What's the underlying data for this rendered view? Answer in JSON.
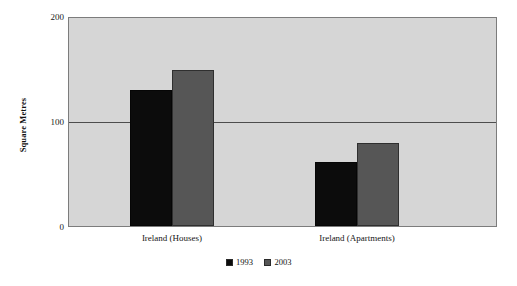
{
  "chart_data": {
    "type": "bar",
    "title": "",
    "subtitle": "",
    "xlabel": "",
    "ylabel": "Square Metres",
    "categories": [
      "Ireland (Houses)",
      "Ireland (Apartments)"
    ],
    "series": [
      {
        "name": "1993",
        "color": "#0c0c0c",
        "values": [
          131,
          62
        ]
      },
      {
        "name": "2003",
        "color": "#565656",
        "values": [
          150,
          80
        ]
      }
    ],
    "ylim": [
      0,
      200
    ],
    "yticks": [
      200,
      100,
      0
    ],
    "ytick_labels": [
      "200",
      "100",
      "0"
    ],
    "gridlines": [
      100
    ],
    "grid": true,
    "legend_position": "bottom-center",
    "plot_background_color": "#d6d6d6",
    "plot_border_color": "#7c7c7c",
    "annotations": []
  },
  "legend": {
    "entries": [
      {
        "label": "1993",
        "swatch": "legend-swatch-black"
      },
      {
        "label": "2003",
        "swatch": "legend-swatch-gray"
      }
    ]
  }
}
